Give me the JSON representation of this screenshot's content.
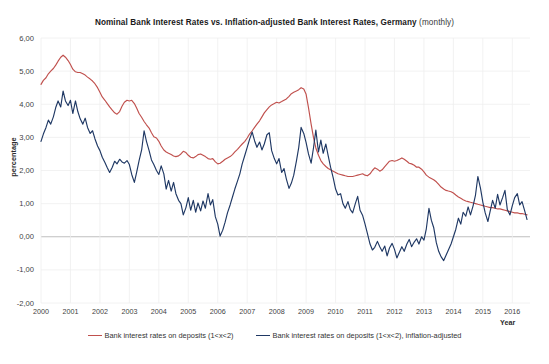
{
  "chart_data": {
    "type": "line",
    "title": "Nominal Bank Interest Rates vs. Inflation-adjusted  Bank Interest Rates, Germany",
    "title_suffix": "(monthly)",
    "subtitle": "",
    "xlabel": "Year",
    "ylabel": "percentage",
    "grid": true,
    "legend_position": "bottom",
    "xlim": [
      2000.0,
      2016.6
    ],
    "ylim": [
      -2.0,
      6.0
    ],
    "ytick_labels": [
      "6,00",
      "5,00",
      "4,00",
      "3,00",
      "2,00",
      "1,00",
      "0,00",
      "-1,00",
      "-2,00"
    ],
    "ytick_values": [
      6,
      5,
      4,
      3,
      2,
      1,
      0,
      -1,
      -2
    ],
    "xtick_labels": [
      "2000",
      "2001",
      "2002",
      "2003",
      "2004",
      "2005",
      "2006",
      "2007",
      "2008",
      "2009",
      "2010",
      "2011",
      "2012",
      "2013",
      "2014",
      "2015",
      "2016"
    ],
    "xtick_values": [
      2000,
      2001,
      2002,
      2003,
      2004,
      2005,
      2006,
      2007,
      2008,
      2009,
      2010,
      2011,
      2012,
      2013,
      2014,
      2015,
      2016
    ],
    "colors": {
      "nominal": "#C0504D",
      "real": "#1F3864",
      "zero_line": "#BFBFBF",
      "grid_line": "#EFEFEF"
    },
    "series": [
      {
        "name": "Bank interest rates on deposits (1<x<2)",
        "color": "#C0504D",
        "x": [
          2000.0,
          2000.08,
          2000.17,
          2000.25,
          2000.33,
          2000.42,
          2000.5,
          2000.58,
          2000.67,
          2000.75,
          2000.83,
          2000.92,
          2001.0,
          2001.08,
          2001.17,
          2001.25,
          2001.33,
          2001.42,
          2001.5,
          2001.58,
          2001.67,
          2001.75,
          2001.83,
          2001.92,
          2002.0,
          2002.08,
          2002.17,
          2002.25,
          2002.33,
          2002.42,
          2002.5,
          2002.58,
          2002.67,
          2002.75,
          2002.83,
          2002.92,
          2003.0,
          2003.08,
          2003.17,
          2003.25,
          2003.33,
          2003.42,
          2003.5,
          2003.58,
          2003.67,
          2003.75,
          2003.83,
          2003.92,
          2004.0,
          2004.08,
          2004.17,
          2004.25,
          2004.33,
          2004.42,
          2004.5,
          2004.58,
          2004.67,
          2004.75,
          2004.83,
          2004.92,
          2005.0,
          2005.08,
          2005.17,
          2005.25,
          2005.33,
          2005.42,
          2005.5,
          2005.58,
          2005.67,
          2005.75,
          2005.83,
          2005.92,
          2006.0,
          2006.08,
          2006.17,
          2006.25,
          2006.33,
          2006.42,
          2006.5,
          2006.58,
          2006.67,
          2006.75,
          2006.83,
          2006.92,
          2007.0,
          2007.08,
          2007.17,
          2007.25,
          2007.33,
          2007.42,
          2007.5,
          2007.58,
          2007.67,
          2007.75,
          2007.83,
          2007.92,
          2008.0,
          2008.08,
          2008.17,
          2008.25,
          2008.33,
          2008.42,
          2008.5,
          2008.58,
          2008.67,
          2008.75,
          2008.83,
          2008.92,
          2009.0,
          2009.08,
          2009.17,
          2009.25,
          2009.33,
          2009.42,
          2009.5,
          2009.58,
          2009.67,
          2009.75,
          2009.83,
          2009.92,
          2010.0,
          2010.08,
          2010.17,
          2010.25,
          2010.33,
          2010.42,
          2010.5,
          2010.58,
          2010.67,
          2010.75,
          2010.83,
          2010.92,
          2011.0,
          2011.08,
          2011.17,
          2011.25,
          2011.33,
          2011.42,
          2011.5,
          2011.58,
          2011.67,
          2011.75,
          2011.83,
          2011.92,
          2012.0,
          2012.08,
          2012.17,
          2012.25,
          2012.33,
          2012.42,
          2012.5,
          2012.58,
          2012.67,
          2012.75,
          2012.83,
          2012.92,
          2013.0,
          2013.08,
          2013.17,
          2013.25,
          2013.33,
          2013.42,
          2013.5,
          2013.58,
          2013.67,
          2013.75,
          2013.83,
          2013.92,
          2014.0,
          2014.08,
          2014.17,
          2014.25,
          2014.33,
          2014.42,
          2014.5,
          2014.58,
          2014.67,
          2014.75,
          2014.83,
          2014.92,
          2015.0,
          2015.08,
          2015.17,
          2015.25,
          2015.33,
          2015.42,
          2015.5,
          2015.58,
          2015.67,
          2015.75,
          2015.83,
          2015.92,
          2016.0,
          2016.08,
          2016.17,
          2016.25,
          2016.33,
          2016.42,
          2016.5
        ],
        "values": [
          4.6,
          4.72,
          4.8,
          4.92,
          5.0,
          5.08,
          5.18,
          5.3,
          5.42,
          5.48,
          5.42,
          5.32,
          5.2,
          5.06,
          4.98,
          4.96,
          4.96,
          4.92,
          4.88,
          4.82,
          4.76,
          4.7,
          4.62,
          4.5,
          4.36,
          4.22,
          4.12,
          4.02,
          3.92,
          3.82,
          3.74,
          3.7,
          3.78,
          3.94,
          4.06,
          4.12,
          4.1,
          4.12,
          4.02,
          3.88,
          3.72,
          3.6,
          3.48,
          3.38,
          3.28,
          3.14,
          3.02,
          2.98,
          2.88,
          2.74,
          2.62,
          2.56,
          2.52,
          2.48,
          2.44,
          2.42,
          2.44,
          2.5,
          2.58,
          2.54,
          2.46,
          2.4,
          2.38,
          2.42,
          2.48,
          2.5,
          2.46,
          2.42,
          2.36,
          2.34,
          2.36,
          2.26,
          2.2,
          2.22,
          2.28,
          2.34,
          2.38,
          2.42,
          2.48,
          2.56,
          2.64,
          2.72,
          2.8,
          2.88,
          2.98,
          3.1,
          3.2,
          3.3,
          3.4,
          3.5,
          3.62,
          3.74,
          3.84,
          3.92,
          3.98,
          4.02,
          4.06,
          4.04,
          4.08,
          4.12,
          4.16,
          4.24,
          4.32,
          4.36,
          4.4,
          4.44,
          4.5,
          4.46,
          4.3,
          3.9,
          3.4,
          3.0,
          2.68,
          2.46,
          2.3,
          2.2,
          2.12,
          2.06,
          2.02,
          1.98,
          1.94,
          1.9,
          1.88,
          1.86,
          1.84,
          1.82,
          1.82,
          1.82,
          1.84,
          1.86,
          1.88,
          1.9,
          1.86,
          1.84,
          1.9,
          2.0,
          2.08,
          2.04,
          1.98,
          2.02,
          2.12,
          2.2,
          2.28,
          2.3,
          2.28,
          2.3,
          2.34,
          2.38,
          2.34,
          2.28,
          2.22,
          2.2,
          2.16,
          2.1,
          2.1,
          2.04,
          1.96,
          1.86,
          1.8,
          1.76,
          1.72,
          1.66,
          1.58,
          1.5,
          1.44,
          1.4,
          1.38,
          1.36,
          1.32,
          1.26,
          1.2,
          1.16,
          1.12,
          1.08,
          1.06,
          1.04,
          1.02,
          1.0,
          0.98,
          0.96,
          0.94,
          0.92,
          0.9,
          0.88,
          0.88,
          0.86,
          0.84,
          0.84,
          0.82,
          0.8,
          0.78,
          0.76,
          0.74,
          0.72,
          0.72,
          0.7,
          0.7,
          0.68,
          0.66
        ]
      },
      {
        "name": "Bank interest rates on deposits (1<x<2), inflation-adjusted",
        "color": "#1F3864",
        "x": [
          2000.0,
          2000.08,
          2000.17,
          2000.25,
          2000.33,
          2000.42,
          2000.5,
          2000.58,
          2000.67,
          2000.75,
          2000.83,
          2000.92,
          2001.0,
          2001.08,
          2001.17,
          2001.25,
          2001.33,
          2001.42,
          2001.5,
          2001.58,
          2001.67,
          2001.75,
          2001.83,
          2001.92,
          2002.0,
          2002.08,
          2002.17,
          2002.25,
          2002.33,
          2002.42,
          2002.5,
          2002.58,
          2002.67,
          2002.75,
          2002.83,
          2002.92,
          2003.0,
          2003.08,
          2003.17,
          2003.25,
          2003.33,
          2003.42,
          2003.5,
          2003.58,
          2003.67,
          2003.75,
          2003.83,
          2003.92,
          2004.0,
          2004.08,
          2004.17,
          2004.25,
          2004.33,
          2004.42,
          2004.5,
          2004.58,
          2004.67,
          2004.75,
          2004.83,
          2004.92,
          2005.0,
          2005.08,
          2005.17,
          2005.25,
          2005.33,
          2005.42,
          2005.5,
          2005.58,
          2005.67,
          2005.75,
          2005.83,
          2005.92,
          2006.0,
          2006.08,
          2006.17,
          2006.25,
          2006.33,
          2006.42,
          2006.5,
          2006.58,
          2006.67,
          2006.75,
          2006.83,
          2006.92,
          2007.0,
          2007.08,
          2007.17,
          2007.25,
          2007.33,
          2007.42,
          2007.5,
          2007.58,
          2007.67,
          2007.75,
          2007.83,
          2007.92,
          2008.0,
          2008.08,
          2008.17,
          2008.25,
          2008.33,
          2008.42,
          2008.5,
          2008.58,
          2008.67,
          2008.75,
          2008.83,
          2008.92,
          2009.0,
          2009.08,
          2009.17,
          2009.25,
          2009.33,
          2009.42,
          2009.5,
          2009.58,
          2009.67,
          2009.75,
          2009.83,
          2009.92,
          2010.0,
          2010.08,
          2010.17,
          2010.25,
          2010.33,
          2010.42,
          2010.5,
          2010.58,
          2010.67,
          2010.75,
          2010.83,
          2010.92,
          2011.0,
          2011.08,
          2011.17,
          2011.25,
          2011.33,
          2011.42,
          2011.5,
          2011.58,
          2011.67,
          2011.75,
          2011.83,
          2011.92,
          2012.0,
          2012.08,
          2012.17,
          2012.25,
          2012.33,
          2012.42,
          2012.5,
          2012.58,
          2012.67,
          2012.75,
          2012.83,
          2012.92,
          2013.0,
          2013.08,
          2013.17,
          2013.25,
          2013.33,
          2013.42,
          2013.5,
          2013.58,
          2013.67,
          2013.75,
          2013.83,
          2013.92,
          2014.0,
          2014.08,
          2014.17,
          2014.25,
          2014.33,
          2014.42,
          2014.5,
          2014.58,
          2014.67,
          2014.75,
          2014.83,
          2014.92,
          2015.0,
          2015.08,
          2015.17,
          2015.25,
          2015.33,
          2015.42,
          2015.5,
          2015.58,
          2015.67,
          2015.75,
          2015.83,
          2015.92,
          2016.0,
          2016.08,
          2016.17,
          2016.25,
          2016.33,
          2016.42,
          2016.5
        ],
        "values": [
          2.88,
          3.1,
          3.3,
          3.52,
          3.4,
          3.62,
          3.9,
          4.1,
          3.92,
          4.4,
          4.1,
          3.96,
          4.12,
          3.72,
          4.1,
          3.78,
          3.56,
          3.4,
          3.58,
          3.3,
          3.12,
          3.2,
          2.96,
          2.74,
          2.6,
          2.4,
          2.24,
          2.08,
          1.94,
          2.1,
          2.28,
          2.2,
          2.34,
          2.26,
          2.22,
          2.3,
          2.18,
          1.88,
          1.64,
          1.96,
          2.3,
          2.64,
          3.2,
          2.88,
          2.6,
          2.32,
          2.18,
          2.0,
          1.88,
          2.14,
          1.9,
          1.44,
          1.7,
          1.38,
          1.64,
          1.3,
          1.1,
          1.0,
          0.66,
          0.88,
          1.18,
          0.8,
          1.1,
          0.74,
          1.02,
          0.78,
          1.08,
          0.86,
          1.3,
          0.96,
          1.12,
          0.6,
          0.38,
          0.02,
          0.2,
          0.44,
          0.72,
          0.96,
          1.2,
          1.44,
          1.68,
          1.9,
          2.2,
          2.46,
          2.7,
          2.94,
          3.16,
          2.9,
          2.7,
          2.86,
          2.62,
          2.8,
          3.08,
          3.14,
          2.6,
          2.36,
          2.2,
          2.36,
          1.94,
          2.06,
          1.74,
          1.46,
          1.62,
          1.86,
          2.28,
          2.7,
          3.3,
          3.12,
          2.84,
          2.5,
          2.22,
          2.68,
          3.22,
          2.56,
          2.92,
          2.52,
          2.8,
          2.44,
          2.1,
          1.78,
          1.44,
          1.26,
          1.3,
          1.0,
          0.86,
          1.06,
          0.82,
          0.72,
          1.0,
          1.22,
          0.8,
          0.64,
          0.38,
          0.1,
          -0.22,
          -0.4,
          -0.32,
          -0.14,
          -0.3,
          -0.44,
          -0.28,
          -0.58,
          -0.34,
          -0.2,
          -0.38,
          -0.64,
          -0.46,
          -0.3,
          -0.44,
          -0.22,
          -0.08,
          -0.3,
          -0.16,
          -0.06,
          -0.22,
          0.0,
          -0.1,
          0.24,
          0.86,
          0.5,
          0.28,
          -0.18,
          -0.44,
          -0.6,
          -0.72,
          -0.56,
          -0.4,
          -0.22,
          0.0,
          0.22,
          0.56,
          0.38,
          0.74,
          0.62,
          0.9,
          0.66,
          0.94,
          1.26,
          1.82,
          1.46,
          1.04,
          0.72,
          0.46,
          0.78,
          1.1,
          0.86,
          1.28,
          0.96,
          1.18,
          1.4,
          0.82,
          0.66,
          0.94,
          1.18,
          1.3,
          0.96,
          1.06,
          0.78,
          0.52
        ]
      }
    ]
  },
  "legend": {
    "items": [
      {
        "label": "Bank interest rates on deposits (1<x<2)",
        "color": "#C0504D"
      },
      {
        "label": "Bank interest rates on deposits (1<x<2), inflation-adjusted",
        "color": "#1F3864"
      }
    ]
  }
}
